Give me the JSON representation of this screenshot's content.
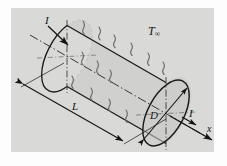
{
  "figure": {
    "kind": "engineering-schematic",
    "background_color": "#fdfdfd",
    "panel_color": "#d9d9d7",
    "ink_color": "#141414",
    "cylinder_fill": "#cfcfcd",
    "labels": {
      "current_left": "I",
      "current_right": "I",
      "ambient_temperature": "T",
      "ambient_temperature_sub": "∞",
      "length": "L",
      "diameter": "D",
      "axis": "x"
    },
    "geometry": {
      "left_face_center_x": 67,
      "left_face_center_y": 56,
      "right_face_center_x": 166,
      "right_face_center_y": 113,
      "face_semi_major": 36,
      "face_semi_minor": 18,
      "face_rotation_deg": -62
    },
    "annotations": {
      "convection_marks": 13,
      "dimension_lines": [
        "length",
        "diameter"
      ],
      "axis_arrow": "x",
      "centerline_style": "dash-dot"
    }
  }
}
